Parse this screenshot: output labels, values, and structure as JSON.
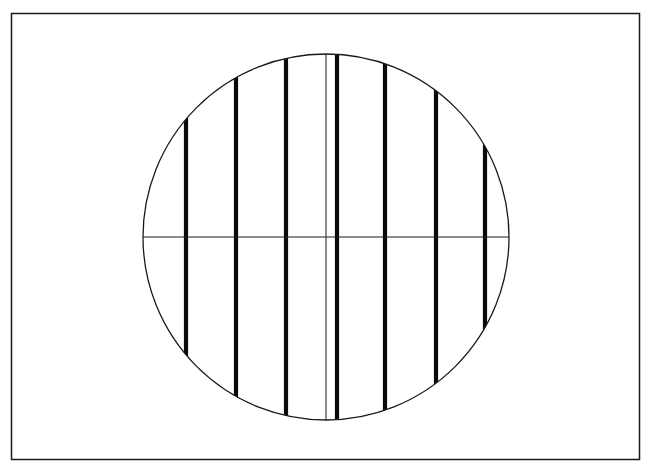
{
  "figure": {
    "colors": {
      "background": "#ffffff",
      "stroke": "#1a1a1a",
      "bars": "#0a0a0a"
    },
    "elements": {
      "frame": "rectangular border",
      "circle": "circular aperture outline",
      "horizontal_diameter": "thin horizontal line through circle center",
      "center_reference_line": "thin vertical line through circle center",
      "bar_count": 7,
      "bars_left_of_center": 3,
      "bars_right_of_center": 4
    }
  }
}
